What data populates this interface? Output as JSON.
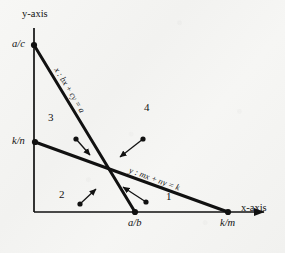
{
  "figure": {
    "background_color": "#f4f4f2",
    "ink_color": "#111111"
  },
  "axes": {
    "x_label": "x-axis",
    "y_label": "y-axis",
    "origin": [
      34,
      212
    ],
    "x_end": [
      270,
      212
    ],
    "y_end": [
      34,
      28
    ]
  },
  "ticks": [
    {
      "name": "y-intercept-line-x",
      "label": "a/c",
      "point": [
        34,
        45
      ]
    },
    {
      "name": "y-intercept-line-y",
      "label": "k/n",
      "point": [
        35,
        142
      ]
    },
    {
      "name": "x-intercept-line-x",
      "label": "a/b",
      "point": [
        135,
        212
      ]
    },
    {
      "name": "x-intercept-line-y",
      "label": "k/m",
      "point": [
        228,
        212
      ]
    }
  ],
  "lines": [
    {
      "name": "line-x",
      "equation": "x : bx + cy = a",
      "from": [
        34,
        45
      ],
      "to": [
        135,
        212
      ],
      "label_angle_deg": 58.8
    },
    {
      "name": "line-y",
      "equation": "y : mx + ny = k",
      "from": [
        35,
        142
      ],
      "to": [
        228,
        212
      ],
      "label_angle_deg": 19.9
    }
  ],
  "intersection": [
    107,
    162
  ],
  "regions": [
    {
      "name": "region-1",
      "label": "1",
      "position": [
        168,
        196
      ]
    },
    {
      "name": "region-2",
      "label": "2",
      "position": [
        61,
        194
      ]
    },
    {
      "name": "region-3",
      "label": "3",
      "position": [
        50,
        117
      ]
    },
    {
      "name": "region-4",
      "label": "4",
      "position": [
        146,
        107
      ]
    }
  ],
  "gradient_arrows": [
    {
      "name": "arrow-region-3",
      "tail": [
        76,
        139
      ],
      "head": [
        91,
        156
      ]
    },
    {
      "name": "arrow-region-4",
      "tail": [
        143,
        139
      ],
      "head": [
        118,
        158
      ]
    },
    {
      "name": "arrow-region-2",
      "tail": [
        80,
        204
      ],
      "head": [
        95,
        188
      ]
    },
    {
      "name": "arrow-region-1",
      "tail": [
        146,
        202
      ],
      "head": [
        121,
        186
      ]
    }
  ]
}
